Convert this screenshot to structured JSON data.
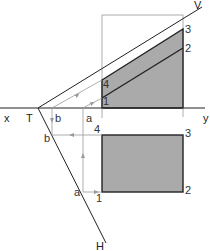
{
  "diagram": {
    "type": "descriptive-geometry-projection",
    "colors": {
      "line": "#222222",
      "construction": "#999999",
      "fill": "#aaaaaa",
      "frame": "#888888"
    },
    "axis_labels": {
      "x": "x",
      "y": "y",
      "trace_point": "T"
    },
    "trace_labels": {
      "vertical": "V",
      "horizontal": "H"
    },
    "vertical_projection_points": {
      "p1": "1",
      "p2": "2",
      "p3": "3",
      "p4": "4"
    },
    "horizontal_projection_points": {
      "p1": "1",
      "p2": "2",
      "p3": "3",
      "p4": "4"
    },
    "axis_point_labels": {
      "a": "a",
      "b": "b"
    },
    "h_trace_point_labels": {
      "a": "a",
      "b": "b"
    }
  }
}
